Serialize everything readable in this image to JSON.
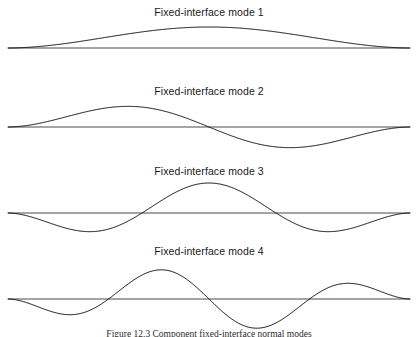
{
  "figure": {
    "caption": "Figure 12.3    Component fixed-interface normal modes",
    "caption_top": 329,
    "width": 418,
    "height": 337,
    "background_color": "#ffffff",
    "curve_color": "#0d0d0d",
    "axis_color": "#4a4a4a"
  },
  "chart_data": {
    "type": "line",
    "title": "Component fixed-interface normal modes",
    "xlabel": "",
    "ylabel": "",
    "grid": false,
    "legend": "none",
    "panel_count": 4,
    "x_domain": [
      0,
      1
    ],
    "axis_x_start_px": 8,
    "axis_x_end_px": 410,
    "panels": [
      {
        "label": "Fixed-interface mode 1",
        "label_top_px": 6,
        "axis_y_px": 48,
        "half_waves": 1,
        "amplitude_px": 21,
        "taper_exponent": 0.85,
        "phase_sign": 1,
        "peaks": [
          {
            "x": 0.5,
            "y": 1.0
          }
        ],
        "zero_crossings": [
          0.0,
          1.0
        ]
      },
      {
        "label": "Fixed-interface mode 2",
        "label_top_px": 85,
        "axis_y_px": 127,
        "half_waves": 2,
        "amplitude_px": 26,
        "taper_exponent": 0.85,
        "phase_sign": 1,
        "peaks": [
          {
            "x": 0.3,
            "y": 1.0
          },
          {
            "x": 0.74,
            "y": -1.0
          }
        ],
        "zero_crossings": [
          0.0,
          0.5,
          1.0
        ]
      },
      {
        "label": "Fixed-interface mode 3",
        "label_top_px": 165,
        "axis_y_px": 213,
        "half_waves": 3,
        "amplitude_px": 30,
        "taper_exponent": 0.8,
        "phase_sign": -1,
        "peaks": [
          {
            "x": 0.18,
            "y": -1.0
          },
          {
            "x": 0.5,
            "y": 1.0
          },
          {
            "x": 0.82,
            "y": -1.0
          }
        ],
        "zero_crossings": [
          0.0,
          0.333,
          0.667,
          1.0
        ]
      },
      {
        "label": "Fixed-interface mode 4",
        "label_top_px": 245,
        "axis_y_px": 299,
        "half_waves": 4,
        "amplitude_px": 31,
        "taper_exponent": 0.8,
        "phase_sign": -1,
        "peaks": [
          {
            "x": 0.14,
            "y": -1.0
          },
          {
            "x": 0.37,
            "y": 1.0
          },
          {
            "x": 0.62,
            "y": -1.0
          },
          {
            "x": 0.86,
            "y": 1.0
          }
        ],
        "zero_crossings": [
          0.0,
          0.25,
          0.5,
          0.75,
          1.0
        ]
      }
    ]
  }
}
